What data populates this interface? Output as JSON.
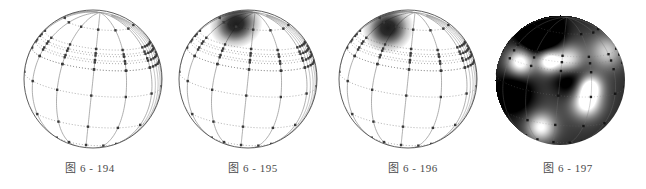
{
  "page": {
    "background_color": "#ffffff",
    "width": 646,
    "height": 189,
    "figure_count": 4
  },
  "figures": [
    {
      "caption": "图 6 - 194",
      "panel_left": 0,
      "panel_width": 180,
      "caption_top": 159,
      "sphere": {
        "center_x": 93,
        "center_y": 79,
        "radius": 69,
        "left": 24,
        "top": 10,
        "style": "wireframe",
        "outline_color": "#4d4d4d",
        "grid_color": "#8c8c8c",
        "node_color": "#3a3a3a",
        "blob": null
      }
    },
    {
      "caption": "图 6 - 195",
      "panel_left": 170,
      "panel_width": 166,
      "caption_top": 159,
      "sphere": {
        "center_x": 248,
        "center_y": 79,
        "radius": 69,
        "left": 179,
        "top": 10,
        "style": "wireframe-with-blob",
        "outline_color": "#4d4d4d",
        "grid_color": "#8c8c8c",
        "node_color": "#3a3a3a",
        "blob": {
          "center_x": 236,
          "center_y": 24,
          "radius_x": 27,
          "radius_y": 24,
          "color": "#141414",
          "rotation": -20
        }
      }
    },
    {
      "caption": "图 6 - 196",
      "panel_left": 330,
      "panel_width": 166,
      "caption_top": 159,
      "sphere": {
        "center_x": 408,
        "center_y": 79,
        "radius": 69,
        "left": 339,
        "top": 10,
        "style": "wireframe-with-blob",
        "outline_color": "#4d4d4d",
        "grid_color": "#8c8c8c",
        "node_color": "#3a3a3a",
        "blob": {
          "center_x": 388,
          "center_y": 28,
          "radius_x": 26,
          "radius_y": 25,
          "color": "#141414",
          "rotation": -30
        }
      }
    },
    {
      "caption": "图 6 - 197",
      "panel_left": 490,
      "panel_width": 156,
      "caption_top": 159,
      "sphere": {
        "center_x": 560,
        "center_y": 80,
        "radius": 65,
        "left": 495,
        "top": 15,
        "style": "grayscale-shaded",
        "outline_color": "#2a2a2a",
        "grid_color": "#6f6f6f",
        "node_color": "#1a1a1a",
        "base_color": "#4a4a4a",
        "blob": null
      }
    }
  ],
  "wireframe_grid": {
    "meridian_count": 7,
    "parallel_latitudes": [
      -60,
      -30,
      0,
      22,
      30,
      36,
      60
    ],
    "meridian_longitudes": [
      -90,
      -60,
      -30,
      0,
      30,
      60,
      90
    ],
    "extra_parallel_cluster": [
      22,
      28,
      34,
      40
    ],
    "node_size_px": 2.4,
    "dotted_dash": "1,2"
  },
  "shaded_sphere_field": {
    "description": "grayscale intensity field",
    "bright_spots": [
      {
        "x": -0.62,
        "y": 0.28,
        "intensity": 0.95,
        "sigma": 0.14
      },
      {
        "x": -0.18,
        "y": 0.3,
        "intensity": 1.0,
        "sigma": 0.12
      },
      {
        "x": 0.12,
        "y": 0.3,
        "intensity": 0.85,
        "sigma": 0.16
      },
      {
        "x": 0.45,
        "y": -0.1,
        "intensity": 1.0,
        "sigma": 0.13
      },
      {
        "x": 0.4,
        "y": -0.35,
        "intensity": 0.9,
        "sigma": 0.15
      },
      {
        "x": -0.3,
        "y": -0.72,
        "intensity": 0.8,
        "sigma": 0.15
      },
      {
        "x": 0.72,
        "y": 0.45,
        "intensity": 0.6,
        "sigma": 0.18
      }
    ],
    "dark_spots": [
      {
        "x": -0.3,
        "y": 0.72,
        "intensity": 1.0,
        "sigma": 0.22
      },
      {
        "x": 0.15,
        "y": 0.05,
        "intensity": 0.55,
        "sigma": 0.2
      },
      {
        "x": -0.7,
        "y": -0.2,
        "intensity": 0.5,
        "sigma": 0.22
      }
    ],
    "base_level": 0.3
  }
}
